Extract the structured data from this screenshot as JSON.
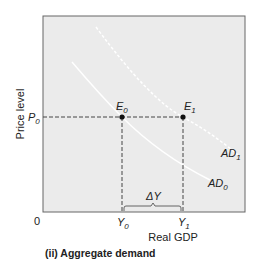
{
  "diagram": {
    "caption": "(ii) Aggregate demand",
    "y_axis_label": "Price level",
    "x_axis_label": "Real GDP",
    "origin_label": "0",
    "price_label": {
      "base": "P",
      "sub": "0"
    },
    "points": [
      {
        "id": "E0",
        "base": "E",
        "sub": "0"
      },
      {
        "id": "E1",
        "base": "E",
        "sub": "1"
      }
    ],
    "x_ticks": [
      {
        "base": "Y",
        "sub": "0"
      },
      {
        "base": "Y",
        "sub": "1"
      }
    ],
    "change_label": "ΔY",
    "curves": [
      {
        "id": "AD1",
        "base": "AD",
        "sub": "1"
      },
      {
        "id": "AD0",
        "base": "AD",
        "sub": "0"
      }
    ],
    "colors": {
      "plot_bg": "#ebebeb",
      "curve": "#ffffff",
      "axis": "#555555",
      "dashed": "#444444"
    }
  }
}
